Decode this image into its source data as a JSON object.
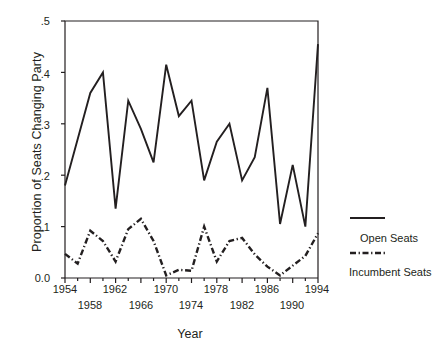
{
  "chart_data": {
    "type": "line",
    "title": "",
    "xlabel": "Year",
    "ylabel": "Proportion of Seats Changing Party",
    "xlim": [
      1954,
      1994
    ],
    "ylim": [
      0.0,
      0.5
    ],
    "grid": false,
    "legend_position": "right",
    "x": [
      1954,
      1956,
      1958,
      1960,
      1962,
      1964,
      1966,
      1968,
      1970,
      1972,
      1974,
      1976,
      1978,
      1980,
      1982,
      1984,
      1986,
      1988,
      1990,
      1992,
      1994
    ],
    "xticks": [
      1954,
      1958,
      1962,
      1966,
      1970,
      1974,
      1978,
      1982,
      1986,
      1990,
      1994
    ],
    "xtick_labels_upper": [
      "1954",
      "1962",
      "1970",
      "1978",
      "1986",
      "1994"
    ],
    "xtick_labels_lower": [
      "1958",
      "1966",
      "1974",
      "1982",
      "1990"
    ],
    "yticks": [
      0.0,
      0.1,
      0.2,
      0.3,
      0.4,
      0.5
    ],
    "ytick_labels": [
      "0.0",
      ".1",
      ".2",
      ".3",
      ".4",
      ".5"
    ],
    "series": [
      {
        "name": "Open Seats",
        "style": "solid",
        "color": "#231f20",
        "values": [
          0.18,
          0.27,
          0.36,
          0.4,
          0.135,
          0.345,
          0.29,
          0.225,
          0.415,
          0.315,
          0.345,
          0.19,
          0.265,
          0.3,
          0.19,
          0.235,
          0.37,
          0.105,
          0.22,
          0.1,
          0.455
        ]
      },
      {
        "name": "Incumbent Seats",
        "style": "dash-dot",
        "color": "#231f20",
        "values": [
          0.047,
          0.028,
          0.092,
          0.072,
          0.032,
          0.095,
          0.115,
          0.072,
          0.005,
          0.016,
          0.014,
          0.1,
          0.032,
          0.072,
          0.078,
          0.046,
          0.022,
          0.005,
          0.024,
          0.043,
          0.087
        ]
      }
    ]
  },
  "legend": {
    "items": [
      {
        "label": "Open Seats",
        "style": "solid"
      },
      {
        "label": "Incumbent Seats",
        "style": "dash-dot"
      }
    ]
  },
  "axes": {
    "y_title": "Proportion of Seats Changing Party",
    "x_title": "Year"
  }
}
